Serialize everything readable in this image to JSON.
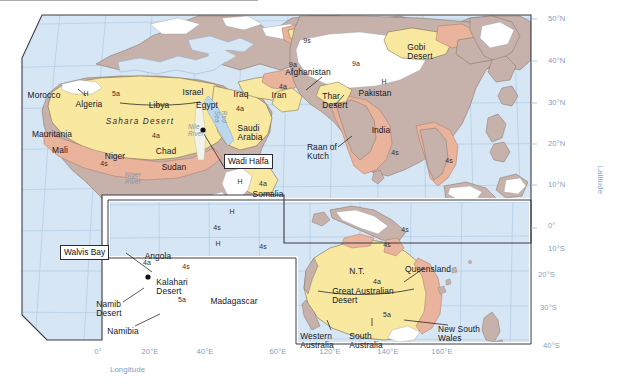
{
  "figure": {
    "kind": "thematic-world-map",
    "palette": {
      "ocean": "#d6e6f4",
      "desert_yellow": "#f8e8a0",
      "steppe_salmon": "#e9b39c",
      "land_mauve": "#c6b2aa",
      "highland_white": "#ffffff",
      "graticule": "#a8c6e2",
      "frame": "#3a3a44",
      "axis_text": "#7f9ec4",
      "label_text": "#16161f",
      "river_text": "#7f94ad"
    }
  },
  "axes": {
    "latitude": {
      "title": "Latitude",
      "ticks": [
        "50°N",
        "40°N",
        "30°N",
        "20°N",
        "10°N",
        "0°",
        "10°S",
        "20°S",
        "30°S",
        "40°S"
      ]
    },
    "longitude": {
      "title": "Longitude",
      "ticks": [
        "0°",
        "20°E",
        "40°E",
        "60°E",
        "120°E",
        "140°E",
        "160°E"
      ]
    }
  },
  "labels": {
    "countries": [
      {
        "text": "Morocco",
        "x": 44,
        "y": 91
      },
      {
        "text": "Algeria",
        "x": 89,
        "y": 100
      },
      {
        "text": "Libya",
        "x": 159,
        "y": 101
      },
      {
        "text": "Egypt",
        "x": 207,
        "y": 101
      },
      {
        "text": "Israel",
        "x": 193,
        "y": 88
      },
      {
        "text": "Iraq",
        "x": 241,
        "y": 90
      },
      {
        "text": "Iran",
        "x": 279,
        "y": 91
      },
      {
        "text": "Mauritania",
        "x": 52,
        "y": 130
      },
      {
        "text": "Mali",
        "x": 60,
        "y": 146
      },
      {
        "text": "Niger",
        "x": 115,
        "y": 152
      },
      {
        "text": "Chad",
        "x": 166,
        "y": 147
      },
      {
        "text": "Sudan",
        "x": 174,
        "y": 163
      },
      {
        "text": "Somalia",
        "x": 268,
        "y": 190
      },
      {
        "text": "Angola",
        "x": 158,
        "y": 252
      },
      {
        "text": "Madagascar",
        "x": 234,
        "y": 297
      },
      {
        "text": "Namibia",
        "x": 123,
        "y": 327
      },
      {
        "text": "Afghanistan",
        "x": 308,
        "y": 68
      },
      {
        "text": "Pakistan",
        "x": 375,
        "y": 89
      },
      {
        "text": "India",
        "x": 381,
        "y": 126
      },
      {
        "text": "Queensland",
        "x": 428,
        "y": 265
      },
      {
        "text": "N.T.",
        "x": 357,
        "y": 267
      }
    ],
    "two_line": [
      {
        "text": "Saudi\nArabia",
        "x": 250,
        "y": 124,
        "align": "center"
      },
      {
        "text": "Thar\nDesert",
        "x": 335,
        "y": 92,
        "align": "center"
      },
      {
        "text": "Gobi\nDesert",
        "x": 420,
        "y": 43,
        "align": "center"
      },
      {
        "text": "Raan of\nKutch",
        "x": 322,
        "y": 143,
        "align": "center"
      },
      {
        "text": "Namib\nDesert",
        "x": 109,
        "y": 300,
        "align": "center"
      },
      {
        "text": "Kalahari\nDesert",
        "x": 172,
        "y": 278,
        "align": "center"
      },
      {
        "text": "Great Australian\nDesert",
        "x": 363,
        "y": 287,
        "align": "center"
      },
      {
        "text": "Western\nAustralia",
        "x": 317,
        "y": 332,
        "align": "center"
      },
      {
        "text": "South\nAustralia",
        "x": 366,
        "y": 332,
        "align": "center"
      },
      {
        "text": "New South\nWales",
        "x": 459,
        "y": 325,
        "align": "center"
      }
    ],
    "physiographic_italic": [
      {
        "text": "Sahara Desert",
        "x": 140,
        "y": 118
      }
    ],
    "rivers": [
      {
        "text": "Nile\nRiver",
        "x": 196,
        "y": 124
      },
      {
        "text": "Niger\nRiver",
        "x": 133,
        "y": 172
      },
      {
        "text": "Red\nSea",
        "x": 214,
        "y": 110,
        "rotate": true
      }
    ],
    "codes": [
      {
        "text": "H",
        "x": 86,
        "y": 90
      },
      {
        "text": "5a",
        "x": 116,
        "y": 90
      },
      {
        "text": "4a",
        "x": 156,
        "y": 132
      },
      {
        "text": "4s",
        "x": 104,
        "y": 160
      },
      {
        "text": "4a",
        "x": 240,
        "y": 105
      },
      {
        "text": "4a",
        "x": 283,
        "y": 83
      },
      {
        "text": "9s",
        "x": 307,
        "y": 37
      },
      {
        "text": "9a",
        "x": 293,
        "y": 61
      },
      {
        "text": "9a",
        "x": 356,
        "y": 60
      },
      {
        "text": "H",
        "x": 384,
        "y": 78
      },
      {
        "text": "H",
        "x": 240,
        "y": 178
      },
      {
        "text": "4a",
        "x": 263,
        "y": 180
      },
      {
        "text": "H",
        "x": 232,
        "y": 208
      },
      {
        "text": "4s",
        "x": 217,
        "y": 224
      },
      {
        "text": "H",
        "x": 218,
        "y": 240
      },
      {
        "text": "4s",
        "x": 263,
        "y": 243
      },
      {
        "text": "4a",
        "x": 147,
        "y": 259
      },
      {
        "text": "4s",
        "x": 186,
        "y": 263
      },
      {
        "text": "5a",
        "x": 182,
        "y": 296
      },
      {
        "text": "4s",
        "x": 387,
        "y": 241
      },
      {
        "text": "4s",
        "x": 405,
        "y": 226
      },
      {
        "text": "4a",
        "x": 377,
        "y": 278
      },
      {
        "text": "5a",
        "x": 387,
        "y": 311
      },
      {
        "text": "4s",
        "x": 395,
        "y": 149
      },
      {
        "text": "4s",
        "x": 449,
        "y": 157
      }
    ],
    "callouts": [
      {
        "text": "Wadi Halfa",
        "x": 224,
        "y": 160
      },
      {
        "text": "Walvis Bay",
        "x": 81,
        "y": 250
      }
    ]
  }
}
